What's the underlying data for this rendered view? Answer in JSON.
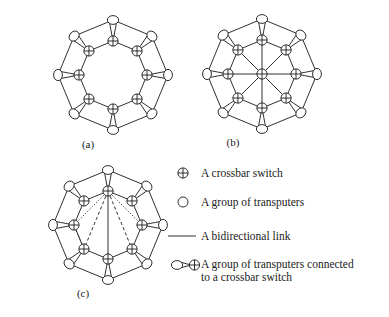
{
  "figure": {
    "style": {
      "stroke": "#1a1a1a",
      "background": "#ffffff",
      "line_width": 0.9
    },
    "captions": {
      "a": "(a)",
      "b": "(b)",
      "c": "(c)"
    },
    "subfigures": [
      {
        "id": "a",
        "caption": "(a)",
        "center": [
          113,
          75
        ],
        "switch_radius": 34,
        "node_radius": 55,
        "node_count": 8,
        "description": "Ring of eight crossbar switches, each linked to an outer group of transputers; outer groups connected in an octagon ring",
        "has_hub": false,
        "has_chords": false
      },
      {
        "id": "b",
        "caption": "(b)",
        "center": [
          262,
          74
        ],
        "switch_radius": 34,
        "node_radius": 55,
        "node_count": 8,
        "description": "Same ring of eight crossbar switches with an additional central crossbar switch hub connected by spokes to all eight ring switches",
        "has_hub": true,
        "has_chords": false
      },
      {
        "id": "c",
        "caption": "(c)",
        "center": [
          108,
          225
        ],
        "switch_radius": 34,
        "node_radius": 55,
        "node_count": 8,
        "description": "Same ring of eight crossbar switches with extra chord links drawn dotted, dashed and solid between non-adjacent switches",
        "has_hub": false,
        "has_chords": true,
        "chords": [
          {
            "from": 0,
            "to": 6,
            "style": "dotted"
          },
          {
            "from": 0,
            "to": 2,
            "style": "dotted"
          },
          {
            "from": 6,
            "to": 5,
            "style": "dotted"
          },
          {
            "from": 0,
            "to": 4,
            "style": "solid"
          },
          {
            "from": 0,
            "to": 5,
            "style": "dashed"
          },
          {
            "from": 0,
            "to": 3,
            "style": "dashed"
          }
        ]
      }
    ]
  },
  "legend": {
    "items": [
      {
        "icon": "crossbar-switch-icon",
        "label": "A crossbar switch"
      },
      {
        "icon": "transputer-group-icon",
        "label": "A group of transputers"
      },
      {
        "icon": "bidirectional-link-icon",
        "label": "A bidirectional link"
      },
      {
        "icon": "transputer-group-connected-icon",
        "label": "A group of transputers connected\nto a crossbar switch"
      }
    ]
  }
}
